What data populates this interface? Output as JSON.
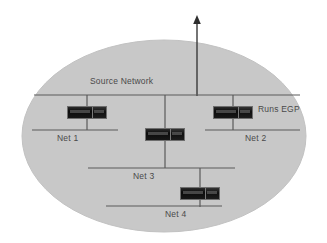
{
  "diagram": {
    "cloud": {
      "name": "autonomous-system-cloud",
      "fill": "#c8c8c8",
      "stroke": "#c0c0c0"
    },
    "colors": {
      "background": "#ffffff",
      "cloud_fill": "#c8c8c8",
      "line": "#5a5a5a",
      "text": "#4a4a4a",
      "router_body": "#111111",
      "router_border": "#6e6e6e"
    },
    "buses": [
      {
        "id": "source-network",
        "label": "Source Network",
        "label_x": 90,
        "label_y": 82,
        "x1": 34,
        "x2": 300,
        "y": 95
      },
      {
        "id": "net-1",
        "label": "Net 1",
        "label_x": 57,
        "label_y": 134,
        "x1": 32,
        "x2": 118,
        "y": 130
      },
      {
        "id": "net-2",
        "label": "Net 2",
        "label_x": 245,
        "label_y": 134,
        "x1": 205,
        "x2": 300,
        "y": 130
      },
      {
        "id": "net-3",
        "label": "Net 3",
        "label_x": 133,
        "label_y": 172,
        "x1": 88,
        "x2": 235,
        "y": 168
      },
      {
        "id": "net-4",
        "label": "Net 4",
        "label_x": 165,
        "label_y": 210,
        "x1": 106,
        "x2": 222,
        "y": 206
      }
    ],
    "routers": [
      {
        "id": "router-net1",
        "x": 67,
        "y": 106,
        "width": 40,
        "height": 13
      },
      {
        "id": "router-net2",
        "x": 213,
        "y": 106,
        "width": 40,
        "height": 13
      },
      {
        "id": "router-net3",
        "x": 145,
        "y": 128,
        "width": 40,
        "height": 13
      },
      {
        "id": "router-net4",
        "x": 180,
        "y": 187,
        "width": 40,
        "height": 13
      }
    ],
    "links": [
      {
        "id": "drop-net1",
        "x1": 87,
        "y1": 95,
        "x2": 87,
        "y2": 130
      },
      {
        "id": "drop-net2",
        "x1": 233,
        "y1": 95,
        "x2": 233,
        "y2": 130
      },
      {
        "id": "drop-net3",
        "x1": 165,
        "y1": 95,
        "x2": 165,
        "y2": 168
      },
      {
        "id": "drop-net4",
        "x1": 200,
        "y1": 168,
        "x2": 200,
        "y2": 206
      }
    ],
    "uplink": {
      "id": "egp-uplink-arrow",
      "x": 197,
      "y_top": 19,
      "y_bottom": 95,
      "label": ""
    },
    "annotations": [
      {
        "id": "runs-egp",
        "text": "Runs EGP",
        "x": 258,
        "y": 108
      }
    ]
  }
}
